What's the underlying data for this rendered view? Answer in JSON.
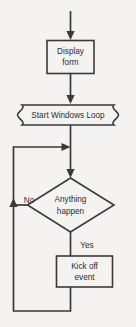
{
  "diagram": {
    "type": "flowchart",
    "background_color": "#f4f3f1",
    "stroke_color": "#3a3a3a",
    "text_color": "#2e2e2e",
    "nodes": [
      {
        "id": "display-form",
        "shape": "process",
        "line1": "Display",
        "line2": "form"
      },
      {
        "id": "start-windows-loop",
        "shape": "loop-limit",
        "line1": "Start Windows Loop"
      },
      {
        "id": "anything-happen",
        "shape": "decision",
        "line1": "Anything",
        "line2": "happen"
      },
      {
        "id": "kick-off-event",
        "shape": "process",
        "line1": "Kick off",
        "line2": "event"
      }
    ],
    "edge_labels": {
      "no": "No",
      "yes": "Yes"
    }
  }
}
